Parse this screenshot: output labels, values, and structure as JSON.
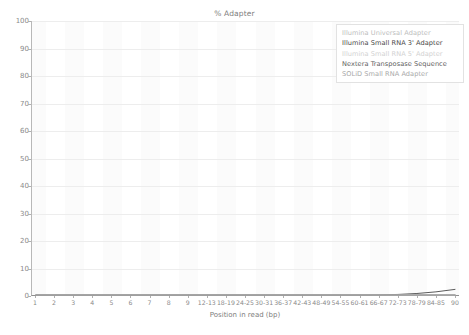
{
  "chart_data": {
    "type": "line",
    "title": "% Adapter",
    "xlabel": "Position in read (bp)",
    "ylabel": "",
    "ylim": [
      0,
      100
    ],
    "grid": true,
    "legend_position": "top-right",
    "categories": [
      "1",
      "2",
      "3",
      "4",
      "5",
      "6",
      "7",
      "8",
      "9",
      "12-13",
      "18-19",
      "24-25",
      "30-31",
      "36-37",
      "42-43",
      "48-49",
      "54-55",
      "60-61",
      "66-67",
      "72-73",
      "78-79",
      "84-85",
      "90"
    ],
    "yticks": [
      "0",
      "10",
      "20",
      "30",
      "40",
      "50",
      "60",
      "70",
      "80",
      "90",
      "100"
    ],
    "ytick_values": [
      0,
      10,
      20,
      30,
      40,
      50,
      60,
      70,
      80,
      90,
      100
    ],
    "series": [
      {
        "name": "Illumina Universal Adapter",
        "color": "#c9c9c9",
        "values": [
          0,
          0,
          0,
          0,
          0,
          0,
          0,
          0,
          0,
          0,
          0,
          0,
          0,
          0,
          0,
          0,
          0,
          0,
          0,
          0,
          0,
          0,
          0
        ]
      },
      {
        "name": "Illumina Small RNA 3' Adapter",
        "color": "#5a5a5a",
        "values": [
          0,
          0,
          0,
          0,
          0,
          0,
          0,
          0,
          0,
          0,
          0,
          0,
          0,
          0,
          0,
          0,
          0,
          0,
          0.05,
          0.2,
          0.55,
          1.15,
          2.05
        ]
      },
      {
        "name": "Illumina Small RNA 5' Adapter",
        "color": "#d8d8d8",
        "values": [
          0,
          0,
          0,
          0,
          0,
          0,
          0,
          0,
          0,
          0,
          0,
          0,
          0,
          0,
          0,
          0,
          0,
          0,
          0,
          0,
          0,
          0,
          0
        ]
      },
      {
        "name": "Nextera Transposase Sequence",
        "color": "#6b6b6b",
        "values": [
          0,
          0,
          0,
          0,
          0,
          0,
          0,
          0,
          0,
          0,
          0,
          0,
          0,
          0,
          0,
          0,
          0,
          0,
          0,
          0,
          0,
          0,
          0
        ]
      },
      {
        "name": "SOLiD Small RNA Adapter",
        "color": "#b5b5b5",
        "values": [
          0,
          0,
          0,
          0,
          0,
          0,
          0,
          0,
          0,
          0,
          0,
          0,
          0,
          0,
          0,
          0,
          0,
          0,
          0,
          0,
          0,
          0,
          0
        ]
      }
    ]
  },
  "legend": {
    "entries": [
      {
        "label": "Illumina Universal Adapter",
        "color": "#bdbdbd"
      },
      {
        "label": "Illumina Small RNA 3' Adapter",
        "color": "#474747"
      },
      {
        "label": "Illumina Small RNA 5' Adapter",
        "color": "#d2d2d2"
      },
      {
        "label": "Nextera Transposase Sequence",
        "color": "#5e5e5e"
      },
      {
        "label": "SOLiD Small RNA Adapter",
        "color": "#a8a8a8"
      }
    ]
  },
  "colors": {
    "axis": "#8f8f8f",
    "grid": "#ededed",
    "band": "#fbfbfb",
    "text": "#8a8a8a",
    "background": "#ffffff"
  }
}
